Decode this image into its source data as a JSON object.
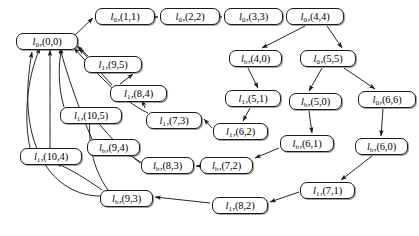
{
  "figure": {
    "background_color": "#ffffff",
    "node_border_color": "#1a1a1a",
    "edge_color": "#1a1a1a"
  },
  "nodes": [
    {
      "id": "n00",
      "base": "l",
      "sub": "0",
      "sep": ",",
      "coord": "(0,0)",
      "x": 16,
      "y": 33,
      "w": 62
    },
    {
      "id": "n11",
      "base": "l",
      "sub": "0",
      "sep": ",",
      "coord": "(1,1)",
      "x": 95,
      "y": 8,
      "w": 60
    },
    {
      "id": "n22",
      "base": "l",
      "sub": "0",
      "sep": ",",
      "coord": "(2,2)",
      "x": 160,
      "y": 8,
      "w": 60
    },
    {
      "id": "n33",
      "base": "l",
      "sub": "0",
      "sep": ",",
      "coord": "(3,3)",
      "x": 224,
      "y": 8,
      "w": 59
    },
    {
      "id": "n44",
      "base": "l",
      "sub": "0",
      "sep": ",",
      "coord": "(4,4)",
      "x": 286,
      "y": 8,
      "w": 58
    },
    {
      "id": "n95",
      "base": "l",
      "sub": "1",
      "sep": ",",
      "coord": "(9,5)",
      "x": 84,
      "y": 56,
      "w": 58
    },
    {
      "id": "n40",
      "base": "l",
      "sub": "b",
      "sep": ",",
      "coord": "(4,0)",
      "x": 229,
      "y": 50,
      "w": 53
    },
    {
      "id": "n55",
      "base": "l",
      "sub": "0",
      "sep": ",",
      "coord": "(5,5)",
      "x": 300,
      "y": 50,
      "w": 56
    },
    {
      "id": "n84",
      "base": "l",
      "sub": "1",
      "sep": ",",
      "coord": "(8,4)",
      "x": 110,
      "y": 85,
      "w": 57
    },
    {
      "id": "n51",
      "base": "l",
      "sub": "1",
      "sep": ",",
      "coord": "(5,1)",
      "x": 225,
      "y": 90,
      "w": 56
    },
    {
      "id": "n50",
      "base": "l",
      "sub": "b",
      "sep": ",",
      "coord": "(5,0)",
      "x": 289,
      "y": 93,
      "w": 53
    },
    {
      "id": "n66",
      "base": "l",
      "sub": "0",
      "sep": ",",
      "coord": "(6,6)",
      "x": 358,
      "y": 91,
      "w": 58
    },
    {
      "id": "n105",
      "base": "l",
      "sub": "1",
      "sep": ",",
      "coord": "(10,5)",
      "x": 60,
      "y": 107,
      "w": 62
    },
    {
      "id": "n73",
      "base": "l",
      "sub": "1",
      "sep": ",",
      "coord": "(7,3)",
      "x": 146,
      "y": 112,
      "w": 56
    },
    {
      "id": "n62",
      "base": "l",
      "sub": "1",
      "sep": ",",
      "coord": "(6,2)",
      "x": 213,
      "y": 123,
      "w": 55
    },
    {
      "id": "n61",
      "base": "l",
      "sub": "b",
      "sep": ",",
      "coord": "(6,1)",
      "x": 280,
      "y": 135,
      "w": 54
    },
    {
      "id": "n60",
      "base": "l",
      "sub": "b",
      "sep": ",",
      "coord": "(6,0)",
      "x": 355,
      "y": 138,
      "w": 53
    },
    {
      "id": "n94",
      "base": "l",
      "sub": "b",
      "sep": ",",
      "coord": "(9,4)",
      "x": 87,
      "y": 139,
      "w": 53
    },
    {
      "id": "n104",
      "base": "l",
      "sub": "1",
      "sep": ",",
      "coord": "(10,4)",
      "x": 20,
      "y": 148,
      "w": 62
    },
    {
      "id": "n83",
      "base": "l",
      "sub": "b",
      "sep": ",",
      "coord": "(8,3)",
      "x": 141,
      "y": 157,
      "w": 53
    },
    {
      "id": "n72",
      "base": "l",
      "sub": "b",
      "sep": ",",
      "coord": "(7,2)",
      "x": 200,
      "y": 157,
      "w": 53
    },
    {
      "id": "n71",
      "base": "l",
      "sub": "1",
      "sep": ",",
      "coord": "(7,1)",
      "x": 300,
      "y": 182,
      "w": 55
    },
    {
      "id": "n93",
      "base": "l",
      "sub": "b",
      "sep": ",",
      "coord": "(9,3)",
      "x": 100,
      "y": 190,
      "w": 53
    },
    {
      "id": "n82",
      "base": "l",
      "sub": "1",
      "sep": ",",
      "coord": "(8,2)",
      "x": 212,
      "y": 197,
      "w": 56
    }
  ],
  "edges": [
    {
      "from": "n00",
      "to": "n11",
      "path": "M 74,36 L 93,18",
      "kind": "straight"
    },
    {
      "from": "n11",
      "to": "n22",
      "path": "M 156,17 L 158,17",
      "kind": "straight"
    },
    {
      "from": "n22",
      "to": "n33",
      "path": "M 221,17 L 222,17",
      "kind": "straight"
    },
    {
      "from": "n33",
      "to": "n44",
      "path": "M 284,17 L 284,17",
      "kind": "straight"
    },
    {
      "from": "n44",
      "to": "n40",
      "path": "M 305,26 L 262,48",
      "kind": "straight"
    },
    {
      "from": "n44",
      "to": "n55",
      "path": "M 327,26 L 342,48",
      "kind": "straight"
    },
    {
      "from": "n40",
      "to": "n51",
      "path": "M 248,68 L 258,88",
      "kind": "straight"
    },
    {
      "from": "n55",
      "to": "n50",
      "path": "M 322,68 L 309,91",
      "kind": "straight"
    },
    {
      "from": "n55",
      "to": "n66",
      "path": "M 344,68 L 375,89",
      "kind": "straight"
    },
    {
      "from": "n51",
      "to": "n62",
      "path": "M 250,108 L 243,121",
      "kind": "straight"
    },
    {
      "from": "n50",
      "to": "n61",
      "path": "M 309,111 L 312,133",
      "kind": "straight"
    },
    {
      "from": "n66",
      "to": "n60",
      "path": "M 383,109 L 381,136",
      "kind": "straight"
    },
    {
      "from": "n62",
      "to": "n73",
      "path": "M 212,128 L 204,119",
      "kind": "straight"
    },
    {
      "from": "n61",
      "to": "n72",
      "path": "M 279,148 L 255,158",
      "kind": "straight"
    },
    {
      "from": "n60",
      "to": "n71",
      "path": "M 372,156 L 341,180",
      "kind": "straight"
    },
    {
      "from": "n72",
      "to": "n83",
      "path": "M 198,166 L 196,166",
      "kind": "straight"
    },
    {
      "from": "n83",
      "to": "n94",
      "path": "M 140,163 L 127,152",
      "kind": "straight"
    },
    {
      "from": "n71",
      "to": "n82",
      "path": "M 299,192 L 270,202",
      "kind": "straight"
    },
    {
      "from": "n82",
      "to": "n93",
      "path": "M 210,203 L 155,197",
      "kind": "straight"
    },
    {
      "from": "n73",
      "to": "n84",
      "path": "M 145,108 L 142,100",
      "kind": "straight"
    },
    {
      "from": "n84",
      "to": "n95",
      "path": "M 120,84 L 133,74",
      "kind": "straight"
    },
    {
      "from": "n95",
      "to": "n00",
      "path": "M 88,56 L 77,46",
      "kind": "straight"
    },
    {
      "from": "n84",
      "to": "n00",
      "path": "M 112,85 C 100,72 88,58 79,48",
      "kind": "curve"
    },
    {
      "from": "n73",
      "to": "n00",
      "path": "M 148,113 C 120,100 92,68 74,48",
      "kind": "curve"
    },
    {
      "from": "n105",
      "to": "n00",
      "path": "M 64,107 C 58,88 58,62 62,48",
      "kind": "curve"
    },
    {
      "from": "n94",
      "to": "n00",
      "path": "M 92,139 C 80,112 66,72 60,48",
      "kind": "curve"
    },
    {
      "from": "n83",
      "to": "n105",
      "path": "M 142,163 C 120,150 104,130 92,115",
      "kind": "curve"
    },
    {
      "from": "n93",
      "to": "n105",
      "path": "M 108,190 C 92,168 88,140 90,118",
      "kind": "curve"
    },
    {
      "from": "n93",
      "to": "n104",
      "path": "M 102,190 C 88,180 72,170 56,163",
      "kind": "curve"
    },
    {
      "from": "n104",
      "to": "n00",
      "path": "M 30,148 C 24,120 26,80 40,48",
      "kind": "curve"
    },
    {
      "from": "n93",
      "to": "n00",
      "path": "M 100,196 C 56,196 14,150 32,52",
      "kind": "curve"
    },
    {
      "from": "n104",
      "to": "n00_b",
      "path": "M 50,148 C 50,120 50,80 50,50",
      "kind": "curve"
    }
  ]
}
